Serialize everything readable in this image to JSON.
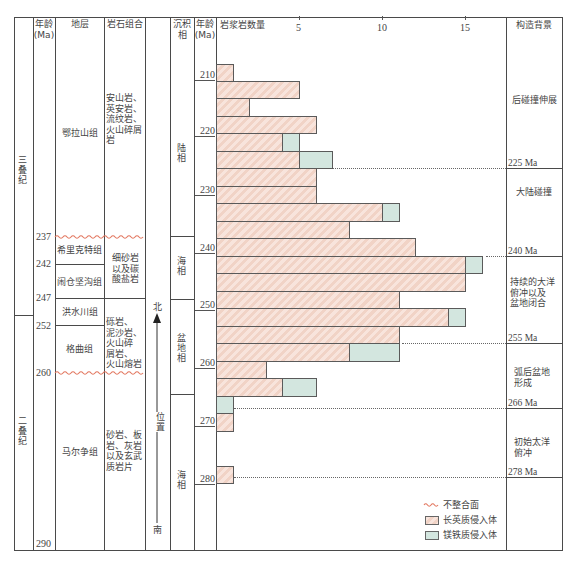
{
  "header": {
    "age_left": "年龄\n(Ma)",
    "strata": "地层",
    "lithology": "岩石组合",
    "facies": "沉积\n相",
    "age_right": "年龄\n(Ma)",
    "magmatic_count": "岩浆岩数量",
    "tectonic": "构造背景"
  },
  "periods": [
    {
      "name": "三叠纪"
    },
    {
      "name": "二叠纪"
    }
  ],
  "age_marks": [
    "237",
    "242",
    "247",
    "252",
    "260",
    "290"
  ],
  "formations": [
    {
      "name": "鄂拉山组"
    },
    {
      "name": "希里克特组"
    },
    {
      "name": "闹仓坚沟组"
    },
    {
      "name": "洪水川组"
    },
    {
      "name": "格曲组"
    },
    {
      "name": "马尔争组"
    }
  ],
  "lithology": [
    {
      "text": "安山岩、\n英安岩、\n流纹岩、\n火山碎屑\n岩"
    },
    {
      "text": "细砂岩\n以及碳\n酸盐岩"
    },
    {
      "text": "砾岩、\n泥沙岩、\n火山碎\n屑岩、\n火山熔岩"
    },
    {
      "text": "砂岩、板\n岩、灰岩\n以及玄武\n质岩片"
    }
  ],
  "position": {
    "north": "北",
    "label": "位置",
    "south": "南"
  },
  "facies": [
    {
      "name": "陆相"
    },
    {
      "name": "海相"
    },
    {
      "name": "盆地相"
    },
    {
      "name": "海相"
    }
  ],
  "tectonic": {
    "stages": [
      {
        "text": "后碰撞伸展"
      },
      {
        "text": "大陆碰撞"
      },
      {
        "text": "持续的大洋\n俯冲以及\n盆地闭合"
      },
      {
        "text": "弧后盆地\n形成"
      },
      {
        "text": "初始太洋\n俯冲"
      }
    ],
    "boundaries": [
      "225 Ma",
      "240 Ma",
      "255 Ma",
      "266 Ma",
      "278 Ma"
    ]
  },
  "legend": [
    {
      "symbol": "wavy-line",
      "label": "不整合面"
    },
    {
      "symbol": "felsic-box",
      "label": "长英质侵入体"
    },
    {
      "symbol": "mafic-box",
      "label": "镁铁质侵入体"
    }
  ],
  "colors": {
    "felsic": "#f5ddd3",
    "mafic": "#d3e6df",
    "unconformity": "#e2765e",
    "frame": "#4a4a4a"
  },
  "chart_data": {
    "type": "bar",
    "orientation": "horizontal",
    "stacked": true,
    "title": "岩浆岩数量",
    "xlabel": "岩浆岩数量",
    "ylabel": "年龄(Ma)",
    "x_ticks": [
      "5",
      "10",
      "15"
    ],
    "y_ticks": [
      "210",
      "220",
      "230",
      "240",
      "250",
      "260",
      "270",
      "280"
    ],
    "xlim": [
      0,
      17.5
    ],
    "ylim": [
      205,
      290
    ],
    "grid": false,
    "legend_position": "lower right",
    "categories": [
      "207-210",
      "210-213",
      "213-216",
      "216-219",
      "219-222",
      "222-225",
      "225-228",
      "228-231",
      "231-234",
      "234-237",
      "237-240",
      "240-243",
      "243-246",
      "246-249",
      "249-252",
      "252-255",
      "255-258",
      "258-261",
      "261-264",
      "264-267",
      "267-270",
      "270-273",
      "273-276",
      "276-279"
    ],
    "series": [
      {
        "name": "长英质侵入体",
        "color": "#f5ddd3",
        "values": [
          1,
          5,
          2,
          6,
          4,
          5,
          6,
          6,
          10,
          8,
          12,
          15,
          15,
          11,
          14,
          11,
          8,
          3,
          4,
          0,
          1,
          0,
          0,
          1
        ]
      },
      {
        "name": "镁铁质侵入体",
        "color": "#d3e6df",
        "values": [
          0,
          0,
          0,
          0,
          1,
          2,
          0,
          0,
          1,
          0,
          0,
          1,
          0,
          0,
          1,
          0,
          3,
          0,
          2,
          1,
          0,
          0,
          0,
          0
        ]
      }
    ],
    "annotations": [
      {
        "age": 225,
        "label": "225 Ma"
      },
      {
        "age": 240,
        "label": "240 Ma"
      },
      {
        "age": 255,
        "label": "255 Ma"
      },
      {
        "age": 266,
        "label": "266 Ma"
      },
      {
        "age": 278,
        "label": "278 Ma"
      }
    ]
  }
}
